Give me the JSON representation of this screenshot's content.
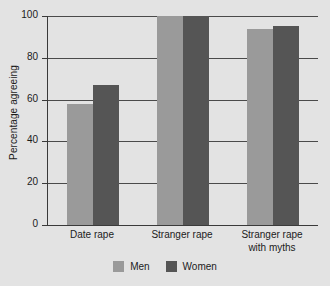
{
  "chart_data": {
    "type": "bar",
    "title": "",
    "subtitle": "",
    "xlabel": "",
    "ylabel": "Percentage agreeing",
    "categories": [
      "Date rape",
      "Stranger rape",
      "Stranger rape\nwith myths"
    ],
    "series": [
      {
        "name": "Men",
        "color": "#9a9a9a",
        "values": [
          58,
          100,
          94
        ]
      },
      {
        "name": "Women",
        "color": "#555555",
        "values": [
          67,
          100,
          95
        ]
      }
    ],
    "ylim": [
      0,
      100
    ],
    "yticks": [
      0,
      20,
      40,
      60,
      80,
      100
    ],
    "ytick_labels": [
      "0",
      "20",
      "40",
      "60",
      "80",
      "100"
    ],
    "grid": true,
    "grid_axis": "y",
    "legend_position": "bottom-center",
    "background_color": "#e3e3e3",
    "axis_color": "#3a3a3a"
  }
}
